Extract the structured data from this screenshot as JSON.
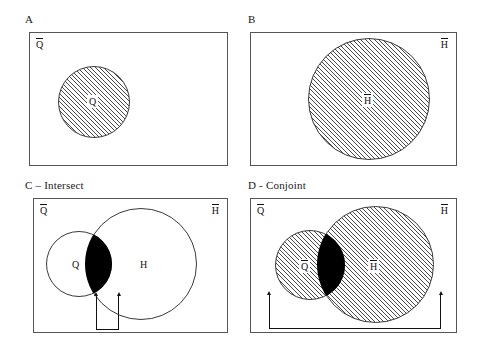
{
  "figure": {
    "width": 479,
    "height": 350,
    "background": "#ffffff",
    "line_color": "#555555",
    "hatch_color": "#4a4a4a",
    "intersection_color": "#000000"
  },
  "panels": [
    {
      "id": "A",
      "title": "A",
      "corner_left_label": "Q",
      "corner_right_label": "",
      "sets": [
        {
          "key": "Q",
          "label": "Q",
          "fill": "hatched",
          "size": "small"
        }
      ],
      "intersection": false,
      "bracket": "none"
    },
    {
      "id": "B",
      "title": "B",
      "corner_left_label": "",
      "corner_right_label": "H",
      "sets": [
        {
          "key": "H",
          "label": "H",
          "fill": "hatched",
          "size": "large"
        }
      ],
      "intersection": false,
      "bracket": "none"
    },
    {
      "id": "C",
      "title": "C – Intersect",
      "corner_left_label": "Q",
      "corner_right_label": "H",
      "sets": [
        {
          "key": "Q",
          "label": "Q",
          "fill": "plain",
          "size": "small"
        },
        {
          "key": "H",
          "label": "H",
          "fill": "plain",
          "size": "large"
        }
      ],
      "intersection": true,
      "bracket": "narrow"
    },
    {
      "id": "D",
      "title": "D - Conjoint",
      "corner_left_label": "Q",
      "corner_right_label": "H",
      "sets": [
        {
          "key": "Q",
          "label": "Q",
          "fill": "hatched",
          "size": "small"
        },
        {
          "key": "H",
          "label": "H",
          "fill": "hatched",
          "size": "large"
        }
      ],
      "intersection": true,
      "bracket": "wide"
    }
  ]
}
